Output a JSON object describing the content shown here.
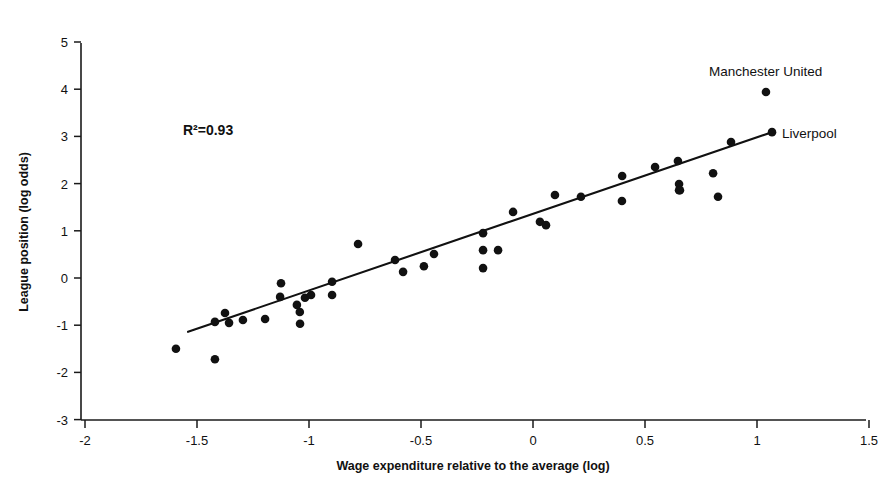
{
  "chart_data": {
    "type": "scatter",
    "title": "",
    "xlabel": "Wage expenditure relative to the average (log)",
    "ylabel": "League position (log odds)",
    "xlim": [
      -2,
      1.5
    ],
    "ylim": [
      -3,
      5
    ],
    "xticks": [
      -2,
      -1.5,
      -1,
      -0.5,
      0,
      0.5,
      1,
      1.5
    ],
    "xticklabels": [
      "-2",
      "-1.5",
      "-1",
      "-0.5",
      "0",
      "0.5",
      "1",
      "1.5"
    ],
    "yticks": [
      -3,
      -2,
      -1,
      0,
      1,
      2,
      3,
      4,
      5
    ],
    "yticklabels": [
      "-3",
      "-2",
      "-1",
      "0",
      "1",
      "2",
      "3",
      "4",
      "5"
    ],
    "grid": false,
    "legend": "none",
    "marker_color": "#111111",
    "line_color": "#111111",
    "points": [
      {
        "x": -1.594,
        "y": -1.5
      },
      {
        "x": -1.42,
        "y": -1.72
      },
      {
        "x": -1.42,
        "y": -0.93
      },
      {
        "x": -1.375,
        "y": -0.74
      },
      {
        "x": -1.357,
        "y": -0.95
      },
      {
        "x": -1.295,
        "y": -0.89
      },
      {
        "x": -1.196,
        "y": -0.87
      },
      {
        "x": -1.129,
        "y": -0.4
      },
      {
        "x": -1.125,
        "y": -0.11
      },
      {
        "x": -1.054,
        "y": -0.57
      },
      {
        "x": -1.041,
        "y": -0.72
      },
      {
        "x": -1.04,
        "y": -0.97
      },
      {
        "x": -1.018,
        "y": -0.42
      },
      {
        "x": -0.991,
        "y": -0.36
      },
      {
        "x": -0.897,
        "y": -0.08
      },
      {
        "x": -0.897,
        "y": -0.36
      },
      {
        "x": -0.781,
        "y": 0.72
      },
      {
        "x": -0.616,
        "y": 0.38
      },
      {
        "x": -0.58,
        "y": 0.13
      },
      {
        "x": -0.487,
        "y": 0.25
      },
      {
        "x": -0.442,
        "y": 0.51
      },
      {
        "x": -0.223,
        "y": 0.95
      },
      {
        "x": -0.223,
        "y": 0.59
      },
      {
        "x": -0.223,
        "y": 0.21
      },
      {
        "x": -0.156,
        "y": 0.59
      },
      {
        "x": -0.089,
        "y": 1.4
      },
      {
        "x": 0.031,
        "y": 1.19
      },
      {
        "x": 0.058,
        "y": 1.12
      },
      {
        "x": 0.098,
        "y": 1.76
      },
      {
        "x": 0.214,
        "y": 1.72
      },
      {
        "x": 0.397,
        "y": 1.63
      },
      {
        "x": 0.398,
        "y": 2.16
      },
      {
        "x": 0.545,
        "y": 2.35
      },
      {
        "x": 0.647,
        "y": 2.48
      },
      {
        "x": 0.652,
        "y": 1.99
      },
      {
        "x": 0.652,
        "y": 1.86
      },
      {
        "x": 0.656,
        "y": 1.86
      },
      {
        "x": 0.804,
        "y": 2.22
      },
      {
        "x": 0.826,
        "y": 1.72
      },
      {
        "x": 0.884,
        "y": 2.88
      },
      {
        "x": 1.04,
        "y": 3.94
      },
      {
        "x": 1.067,
        "y": 3.09
      }
    ],
    "fit_line": {
      "x1": -1.54,
      "y1": -1.14,
      "x2": 1.067,
      "y2": 3.09
    },
    "annotations": [
      {
        "id": "r-squared",
        "text": "R²=0.93",
        "x": -1.56,
        "y": 3.15
      },
      {
        "id": "manchester-united",
        "text": "Manchester United",
        "x": 0.8,
        "y": 4.58
      },
      {
        "id": "liverpool",
        "text": "Liverpool",
        "x": 1.11,
        "y": 3.06
      }
    ]
  }
}
